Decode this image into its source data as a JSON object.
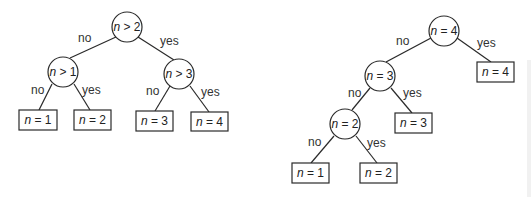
{
  "diagrams": [
    {
      "name": "balanced-decision-tree",
      "nodes": [
        {
          "id": "root",
          "type": "decision",
          "var": "n",
          "op": " > ",
          "val": "2"
        },
        {
          "id": "l",
          "type": "decision",
          "var": "n",
          "op": " > ",
          "val": "1"
        },
        {
          "id": "r",
          "type": "decision",
          "var": "n",
          "op": " > ",
          "val": "3"
        },
        {
          "id": "leaf1",
          "type": "leaf",
          "var": "n",
          "op": " = ",
          "val": "1"
        },
        {
          "id": "leaf2",
          "type": "leaf",
          "var": "n",
          "op": " = ",
          "val": "2"
        },
        {
          "id": "leaf3",
          "type": "leaf",
          "var": "n",
          "op": " = ",
          "val": "3"
        },
        {
          "id": "leaf4",
          "type": "leaf",
          "var": "n",
          "op": " = ",
          "val": "4"
        }
      ],
      "edges": [
        {
          "from": "root",
          "to": "l",
          "label": "no"
        },
        {
          "from": "root",
          "to": "r",
          "label": "yes"
        },
        {
          "from": "l",
          "to": "leaf1",
          "label": "no"
        },
        {
          "from": "l",
          "to": "leaf2",
          "label": "yes"
        },
        {
          "from": "r",
          "to": "leaf3",
          "label": "no"
        },
        {
          "from": "r",
          "to": "leaf4",
          "label": "yes"
        }
      ]
    },
    {
      "name": "linear-decision-tree",
      "nodes": [
        {
          "id": "root",
          "type": "decision",
          "var": "n",
          "op": " = ",
          "val": "4"
        },
        {
          "id": "d3",
          "type": "decision",
          "var": "n",
          "op": " = ",
          "val": "3"
        },
        {
          "id": "d2",
          "type": "decision",
          "var": "n",
          "op": " = ",
          "val": "2"
        },
        {
          "id": "leaf4",
          "type": "leaf",
          "var": "n",
          "op": " = ",
          "val": "4"
        },
        {
          "id": "leaf3",
          "type": "leaf",
          "var": "n",
          "op": " = ",
          "val": "3"
        },
        {
          "id": "leaf1",
          "type": "leaf",
          "var": "n",
          "op": " = ",
          "val": "1"
        },
        {
          "id": "leaf2",
          "type": "leaf",
          "var": "n",
          "op": " = ",
          "val": "2"
        }
      ],
      "edges": [
        {
          "from": "root",
          "to": "d3",
          "label": "no"
        },
        {
          "from": "root",
          "to": "leaf4",
          "label": "yes"
        },
        {
          "from": "d3",
          "to": "d2",
          "label": "no"
        },
        {
          "from": "d3",
          "to": "leaf3",
          "label": "yes"
        },
        {
          "from": "d2",
          "to": "leaf1",
          "label": "no"
        },
        {
          "from": "d2",
          "to": "leaf2",
          "label": "yes"
        }
      ]
    }
  ]
}
